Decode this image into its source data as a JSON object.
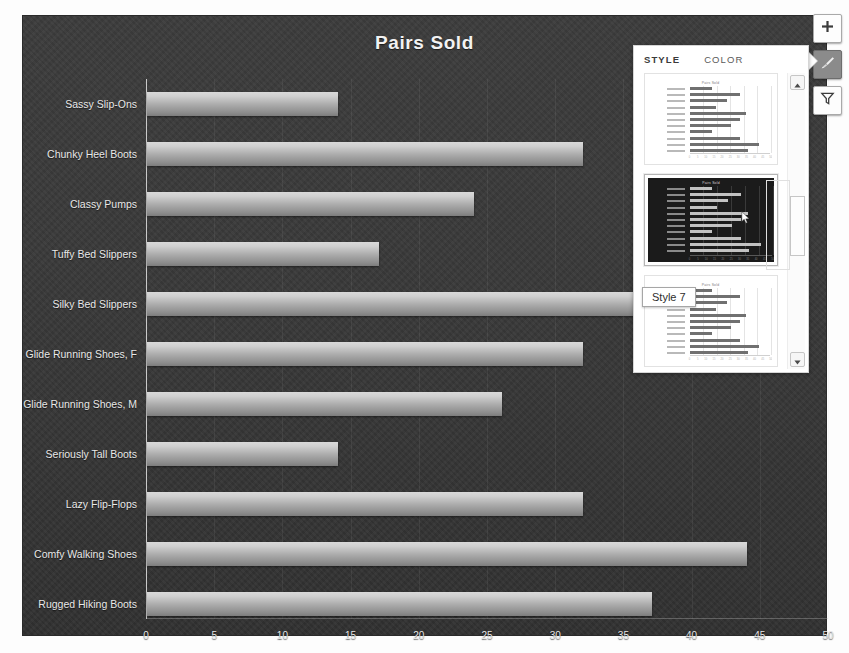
{
  "chart_data": {
    "type": "bar",
    "orientation": "horizontal",
    "title": "Pairs Sold",
    "xlabel": "",
    "ylabel": "",
    "xlim": [
      0,
      50
    ],
    "xticks": [
      0,
      5,
      10,
      15,
      20,
      25,
      30,
      35,
      40,
      45,
      50
    ],
    "grid": true,
    "categories": [
      "Sassy Slip-Ons",
      "Chunky Heel Boots",
      "Classy Pumps",
      "Tuffy Bed Slippers",
      "Silky Bed Slippers",
      "Glide Running Shoes, F",
      "Glide Running Shoes, M",
      "Seriously Tall Boots",
      "Lazy Flip-Flops",
      "Comfy Walking Shoes",
      "Rugged Hiking Boots"
    ],
    "values": [
      14,
      32,
      24,
      17,
      36,
      32,
      26,
      14,
      32,
      44,
      37
    ],
    "series_name": "Pairs Sold",
    "bar_color": "#b4b4b4",
    "plot_background": "#383838",
    "text_color": "#e8e8e8"
  },
  "chart_buttons": [
    {
      "name": "chart-elements",
      "icon": "plus-icon",
      "active": false
    },
    {
      "name": "chart-styles",
      "icon": "brush-icon",
      "active": true
    },
    {
      "name": "chart-filters",
      "icon": "funnel-icon",
      "active": false
    }
  ],
  "style_panel": {
    "tabs": [
      {
        "label": "STYLE",
        "selected": true
      },
      {
        "label": "COLOR",
        "selected": false
      }
    ],
    "tooltip": "Style 7",
    "thumbnails": [
      {
        "name": "style-thumbnail-6",
        "theme": "light",
        "selected": false,
        "title": "Pairs Sold"
      },
      {
        "name": "style-thumbnail-7",
        "theme": "dark",
        "selected": true,
        "title": "Pairs Sold"
      },
      {
        "name": "style-thumbnail-8",
        "theme": "light",
        "selected": false,
        "title": "Pairs Sold"
      }
    ],
    "scroll": {
      "up_icon": "triangle-up-icon",
      "down_icon": "triangle-down-icon"
    }
  }
}
